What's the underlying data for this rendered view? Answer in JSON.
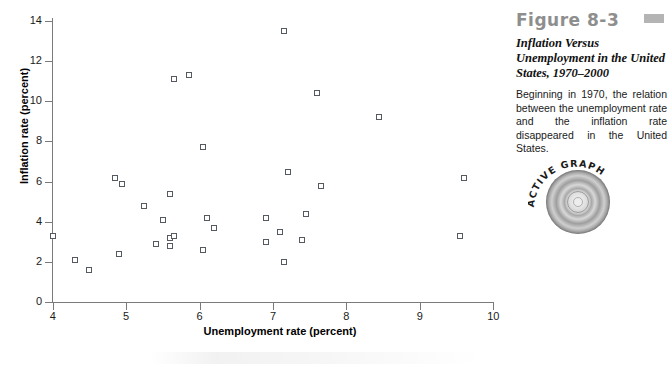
{
  "figure": {
    "number_label": "Figure 8-3",
    "title": "Inflation Versus Unemployment in the United States, 1970–2000",
    "body_text": "Beginning in 1970, the relation between the unemployment rate and the inflation rate disappeared in the United States.",
    "active_graph_label": "ACTIVE GRAPH",
    "swatch_color": "#b4b4b4",
    "number_color": "#8e8e8e"
  },
  "chart_data": {
    "type": "scatter",
    "title": "",
    "xlabel": "Unemployment rate (percent)",
    "ylabel": "Inflation rate (percent)",
    "xlim": [
      4,
      10
    ],
    "ylim": [
      0,
      14
    ],
    "xticks": [
      4,
      5,
      6,
      7,
      8,
      9,
      10
    ],
    "yticks": [
      0,
      2,
      4,
      6,
      8,
      10,
      12,
      14
    ],
    "grid": false,
    "legend": null,
    "marker": "open-square",
    "marker_color": "#555a60",
    "points": [
      {
        "x": 4.0,
        "y": 3.3
      },
      {
        "x": 4.3,
        "y": 2.1
      },
      {
        "x": 4.5,
        "y": 1.6
      },
      {
        "x": 4.85,
        "y": 6.2
      },
      {
        "x": 4.95,
        "y": 5.9
      },
      {
        "x": 4.9,
        "y": 2.4
      },
      {
        "x": 5.25,
        "y": 4.8
      },
      {
        "x": 5.5,
        "y": 4.1
      },
      {
        "x": 5.4,
        "y": 2.9
      },
      {
        "x": 5.6,
        "y": 3.2
      },
      {
        "x": 5.6,
        "y": 2.8
      },
      {
        "x": 5.6,
        "y": 5.4
      },
      {
        "x": 5.65,
        "y": 11.1
      },
      {
        "x": 5.85,
        "y": 11.3
      },
      {
        "x": 6.05,
        "y": 7.7
      },
      {
        "x": 7.15,
        "y": 13.5
      },
      {
        "x": 5.6,
        "y": 5.4
      },
      {
        "x": 6.1,
        "y": 4.2
      },
      {
        "x": 6.2,
        "y": 3.7
      },
      {
        "x": 6.05,
        "y": 2.6
      },
      {
        "x": 5.65,
        "y": 3.3
      },
      {
        "x": 6.9,
        "y": 4.2
      },
      {
        "x": 6.9,
        "y": 3.0
      },
      {
        "x": 7.1,
        "y": 3.5
      },
      {
        "x": 7.2,
        "y": 6.5
      },
      {
        "x": 7.15,
        "y": 2.0
      },
      {
        "x": 7.45,
        "y": 4.4
      },
      {
        "x": 7.4,
        "y": 3.1
      },
      {
        "x": 7.6,
        "y": 10.4
      },
      {
        "x": 7.65,
        "y": 5.8
      },
      {
        "x": 8.45,
        "y": 9.2
      },
      {
        "x": 9.6,
        "y": 6.2
      },
      {
        "x": 9.55,
        "y": 3.3
      }
    ]
  }
}
